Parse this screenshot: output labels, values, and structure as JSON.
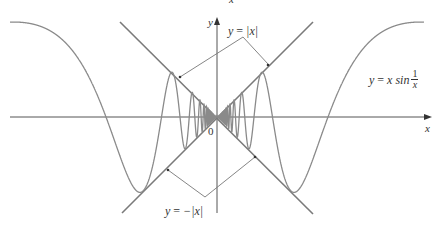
{
  "figure": {
    "title_fragment": "x",
    "axes": {
      "x_label": "x",
      "y_label": "y",
      "origin_label": "0"
    },
    "labels": {
      "upper_envelope": {
        "lhs": "y",
        "eq": "=",
        "rhs": "|x|"
      },
      "lower_envelope": {
        "lhs": "y",
        "eq": "=",
        "rhs": "−|x|"
      },
      "curve": {
        "lhs": "y",
        "eq": "=",
        "mid": "x sin",
        "num": "1",
        "den": "x"
      }
    },
    "colors": {
      "curve": "#8a8a8a",
      "envelope": "#7a7a7a",
      "axis": "#555555",
      "pointer": "#777777",
      "text": "#333333"
    }
  },
  "chart_data": {
    "type": "line",
    "title": "",
    "xlabel": "x",
    "ylabel": "y",
    "series": [
      {
        "name": "y = x sin(1/x)",
        "expression": "x*sin(1/x)"
      },
      {
        "name": "y = |x|",
        "expression": "abs(x)"
      },
      {
        "name": "y = -|x|",
        "expression": "-abs(x)"
      }
    ],
    "annotations": [
      "y = |x|",
      "y = −|x|",
      "y = x sin 1/x",
      "0"
    ],
    "grid": false,
    "legend": "none"
  }
}
